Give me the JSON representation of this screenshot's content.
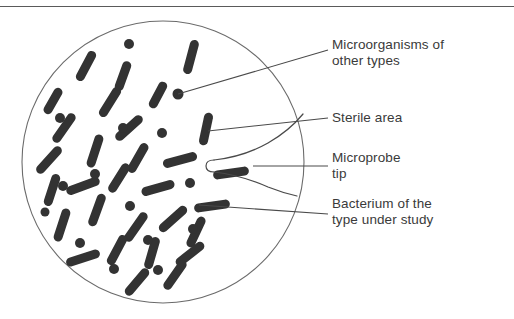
{
  "figure": {
    "background_color": "#ffffff",
    "border": {
      "top_rule_color": "#5a5a5a"
    }
  },
  "colors": {
    "organism": "#333333",
    "dish_outline": "#6b6b6b",
    "leader_line": "#4a4a4a",
    "probe_outline": "#4a4a4a",
    "text": "#3a3a3a"
  },
  "dish": {
    "name": "petri-dish",
    "center_x": 163,
    "center_y": 162,
    "radius": 141
  },
  "labels": [
    {
      "id": "microorganisms-other",
      "text": "Microorganisms of\nother types",
      "x": 332,
      "y": 37
    },
    {
      "id": "sterile-area",
      "text": "Sterile area",
      "x": 332,
      "y": 110
    },
    {
      "id": "microprobe-tip",
      "text": "Microprobe\ntip",
      "x": 332,
      "y": 150
    },
    {
      "id": "bacterium-type",
      "text": "Bacterium of the\ntype under study",
      "x": 332,
      "y": 196
    }
  ],
  "leader_lines": [
    {
      "id": "leader-microorganisms",
      "x1": 178,
      "y1": 94,
      "x2": 328,
      "y2": 50
    },
    {
      "id": "leader-sterile",
      "x1": 208,
      "y1": 131,
      "x2": 328,
      "y2": 118
    },
    {
      "id": "leader-probe",
      "x1": 253,
      "y1": 166,
      "x2": 328,
      "y2": 166
    },
    {
      "id": "leader-bacterium",
      "x1": 199,
      "y1": 205,
      "x2": 328,
      "y2": 214
    }
  ],
  "microprobe": {
    "name": "microprobe-needle",
    "tip_x": 212,
    "tip_y": 166,
    "description": "tapering needle entering from right edge, rounded tip pointing left"
  },
  "organisms": {
    "rods": [
      {
        "x": 191,
        "y": 57,
        "angle": 75,
        "len": 26
      },
      {
        "x": 110,
        "y": 102,
        "angle": 58,
        "len": 25
      },
      {
        "x": 86,
        "y": 66,
        "angle": 62,
        "len": 24
      },
      {
        "x": 129,
        "y": 128,
        "angle": 42,
        "len": 25
      },
      {
        "x": 206,
        "y": 129,
        "angle": 78,
        "len": 24
      },
      {
        "x": 64,
        "y": 128,
        "angle": 55,
        "len": 25
      },
      {
        "x": 123,
        "y": 76,
        "angle": 70,
        "len": 22
      },
      {
        "x": 158,
        "y": 95,
        "angle": 62,
        "len": 20
      },
      {
        "x": 49,
        "y": 160,
        "angle": 48,
        "len": 25
      },
      {
        "x": 95,
        "y": 151,
        "angle": 72,
        "len": 25
      },
      {
        "x": 138,
        "y": 158,
        "angle": 60,
        "len": 24
      },
      {
        "x": 180,
        "y": 160,
        "angle": 15,
        "len": 26
      },
      {
        "x": 231,
        "y": 173,
        "angle": 8,
        "len": 27
      },
      {
        "x": 83,
        "y": 186,
        "angle": 20,
        "len": 26
      },
      {
        "x": 52,
        "y": 190,
        "angle": 72,
        "len": 24
      },
      {
        "x": 119,
        "y": 178,
        "angle": 58,
        "len": 24
      },
      {
        "x": 158,
        "y": 188,
        "angle": 16,
        "len": 25
      },
      {
        "x": 212,
        "y": 206,
        "angle": 8,
        "len": 27
      },
      {
        "x": 97,
        "y": 210,
        "angle": 70,
        "len": 25
      },
      {
        "x": 62,
        "y": 225,
        "angle": 72,
        "len": 25
      },
      {
        "x": 136,
        "y": 227,
        "angle": 55,
        "len": 25
      },
      {
        "x": 173,
        "y": 219,
        "angle": 42,
        "len": 26
      },
      {
        "x": 196,
        "y": 232,
        "angle": 65,
        "len": 24
      },
      {
        "x": 117,
        "y": 250,
        "angle": 62,
        "len": 24
      },
      {
        "x": 83,
        "y": 258,
        "angle": 18,
        "len": 26
      },
      {
        "x": 152,
        "y": 253,
        "angle": 74,
        "len": 24
      },
      {
        "x": 190,
        "y": 254,
        "angle": 38,
        "len": 25
      },
      {
        "x": 175,
        "y": 275,
        "angle": 55,
        "len": 25
      },
      {
        "x": 137,
        "y": 282,
        "angle": 50,
        "len": 24
      },
      {
        "x": 53,
        "y": 101,
        "angle": 60,
        "len": 20
      }
    ],
    "dots": [
      {
        "x": 129,
        "y": 44,
        "r": 5
      },
      {
        "x": 178,
        "y": 94,
        "r": 5.5
      },
      {
        "x": 60,
        "y": 118,
        "r": 5
      },
      {
        "x": 123,
        "y": 128,
        "r": 5
      },
      {
        "x": 162,
        "y": 133,
        "r": 5
      },
      {
        "x": 95,
        "y": 174,
        "r": 5
      },
      {
        "x": 63,
        "y": 186,
        "r": 5
      },
      {
        "x": 190,
        "y": 183,
        "r": 5
      },
      {
        "x": 130,
        "y": 206,
        "r": 5
      },
      {
        "x": 193,
        "y": 229,
        "r": 5
      },
      {
        "x": 80,
        "y": 243,
        "r": 5
      },
      {
        "x": 148,
        "y": 240,
        "r": 5
      },
      {
        "x": 114,
        "y": 269,
        "r": 5
      },
      {
        "x": 158,
        "y": 270,
        "r": 5
      },
      {
        "x": 45,
        "y": 212,
        "r": 4.5
      }
    ]
  }
}
